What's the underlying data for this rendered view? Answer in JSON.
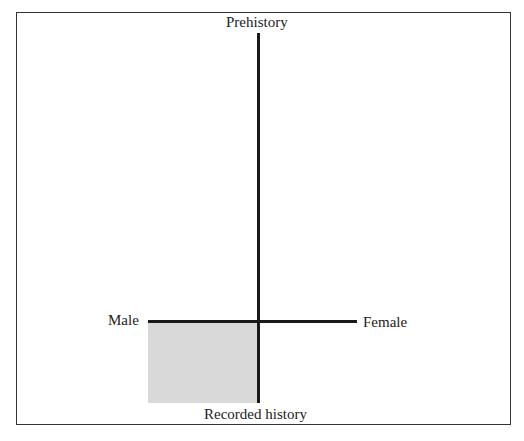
{
  "diagram": {
    "axes": {
      "top": "Prehistory",
      "bottom": "Recorded history",
      "left": "Male",
      "right": "Female"
    },
    "shaded_quadrant": "Male / Recorded history",
    "colors": {
      "line": "#1a1a1a",
      "shade": "#d9d9d9",
      "border": "#333333"
    }
  }
}
